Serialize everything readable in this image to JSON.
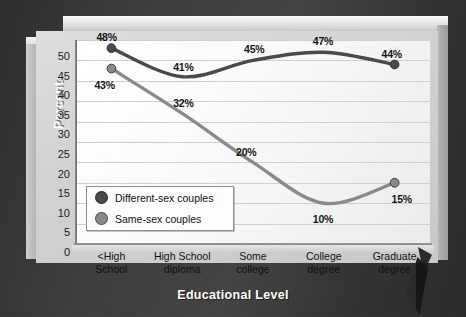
{
  "chart_data": {
    "type": "line",
    "title": "",
    "xlabel": "Educational Level",
    "ylabel": "Percent",
    "categories": [
      "<High\nSchool",
      "High School\ndiploma",
      "Some\ncollege",
      "College\ndegree",
      "Graduate\ndegree"
    ],
    "ylim": [
      0,
      50
    ],
    "yticks": [
      0,
      5,
      10,
      15,
      20,
      25,
      30,
      35,
      40,
      45,
      50
    ],
    "grid": true,
    "legend_position": "inside-lower-left",
    "series": [
      {
        "name": "Different-sex couples",
        "color": "#4a4a4a",
        "values": [
          48,
          41,
          45,
          47,
          44
        ],
        "labels": [
          "48%",
          "41%",
          "45%",
          "47%",
          "44%"
        ]
      },
      {
        "name": "Same-sex couples",
        "color": "#8a8a8a",
        "values": [
          43,
          32,
          20,
          10,
          15
        ],
        "labels": [
          "43%",
          "32%",
          "20%",
          "10%",
          "15%"
        ]
      }
    ]
  },
  "axis": {
    "y_title": "Percent",
    "x_title": "Educational Level",
    "y_ticks": [
      "50",
      "45",
      "40",
      "35",
      "30",
      "25",
      "20",
      "15",
      "10",
      "5",
      "0"
    ]
  },
  "categories": [
    {
      "line1": "<High",
      "line2": "School"
    },
    {
      "line1": "High School",
      "line2": "diploma"
    },
    {
      "line1": "Some",
      "line2": "college"
    },
    {
      "line1": "College",
      "line2": "degree"
    },
    {
      "line1": "Graduate",
      "line2": "degree"
    }
  ],
  "legend": {
    "items": [
      {
        "label": "Different-sex couples",
        "color": "#4a4a4a"
      },
      {
        "label": "Same-sex couples",
        "color": "#8a8a8a"
      }
    ]
  },
  "colors": {
    "background": "#3a3a3a",
    "plot_area": "#fafafa",
    "grid": "#cfcfcf",
    "series_different_sex": "#4a4a4a",
    "series_same_sex": "#8a8a8a",
    "axis_title_text": "#ffffff"
  }
}
